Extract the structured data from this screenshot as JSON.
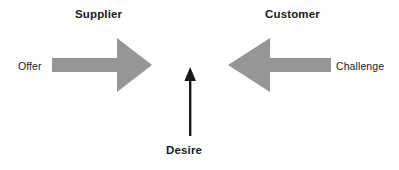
{
  "diagram": {
    "background_color": "#ffffff",
    "arrow_fill_color": "#969696",
    "vertical_arrow_color": "#1a1a1a",
    "text_color": "#1a1a1a",
    "width": 399,
    "height": 170
  },
  "labels": {
    "supplier": "Supplier",
    "customer": "Customer",
    "offer": "Offer",
    "challenge": "Challenge",
    "desire": "Desire"
  },
  "arrows": {
    "offer_to_supplier": {
      "icon": "right-arrow-icon",
      "direction": "right",
      "color": "#969696",
      "from_label": "Offer",
      "to_label": "Supplier"
    },
    "challenge_to_customer": {
      "icon": "left-arrow-icon",
      "direction": "left",
      "color": "#969696",
      "from_label": "Challenge",
      "to_label": "Customer"
    },
    "desire_upward": {
      "icon": "up-arrow-icon",
      "direction": "up",
      "color": "#1a1a1a",
      "from_label": "Desire"
    }
  }
}
